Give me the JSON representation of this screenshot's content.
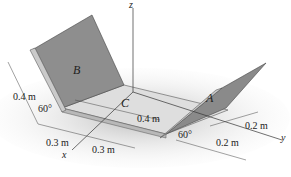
{
  "figure": {
    "axes": {
      "x": "x",
      "y": "y",
      "z": "z"
    },
    "plates": {
      "left": "B",
      "right": "A",
      "center_point": "C"
    },
    "dimensions": {
      "left_height": "0.4 m",
      "left_angle": "60°",
      "base_x_1": "0.3 m",
      "base_x_2": "0.3 m",
      "base_depth": "0.4 m",
      "right_angle": "60°",
      "right_y_1": "0.2 m",
      "right_y_2": "0.2 m"
    },
    "colors": {
      "plate_face": "#8e8e8e",
      "plate_edge": "#c9c9c9",
      "base": "#dcdcdc",
      "shadow": "#bdbdbd",
      "line": "#333333"
    }
  }
}
